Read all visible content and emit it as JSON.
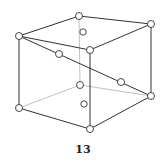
{
  "figure": {
    "label": "13",
    "stroke_color": "#333333",
    "hidden_edge_color": "#b0b0b0",
    "node_fill": "#ffffff"
  },
  "vertices": {
    "top_left": [
      19,
      36
    ],
    "top_back": [
      79,
      16
    ],
    "top_right": [
      151,
      24
    ],
    "top_front": [
      90,
      50
    ],
    "bottom_left": [
      19,
      108
    ],
    "bottom_back": [
      80,
      85
    ],
    "bottom_right": [
      151,
      96
    ],
    "bottom_front": [
      90,
      129
    ]
  },
  "extra_nodes": [
    [
      59,
      54
    ],
    [
      121,
      82
    ],
    [
      83,
      32
    ],
    [
      84,
      104
    ]
  ]
}
